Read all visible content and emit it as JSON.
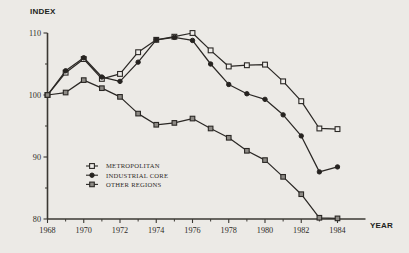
{
  "chart_data": {
    "type": "line",
    "title": "",
    "xlabel": "YEAR",
    "ylabel": "INDEX",
    "xlim": [
      1968,
      1984
    ],
    "ylim": [
      80,
      110
    ],
    "yticks": [
      80,
      90,
      100,
      110
    ],
    "ytick_labels": [
      "80",
      "90",
      "100",
      "110"
    ],
    "xticks": [
      1968,
      1969,
      1970,
      1971,
      1972,
      1973,
      1974,
      1975,
      1976,
      1977,
      1978,
      1979,
      1980,
      1981,
      1982,
      1983,
      1984
    ],
    "xtick_labels_shown": [
      "1968",
      "1970",
      "1972",
      "1974",
      "1980",
      "1982",
      "1984"
    ],
    "xtick_labels_all": [
      "1968",
      "",
      "1970",
      "",
      "1972",
      "",
      "1974",
      "",
      "1976",
      "",
      "1978",
      "",
      "1980",
      "",
      "1982",
      "",
      "1984"
    ],
    "grid": false,
    "legend_position": "lower-left-inside",
    "x": [
      1968,
      1969,
      1970,
      1971,
      1972,
      1973,
      1974,
      1975,
      1976,
      1977,
      1978,
      1979,
      1980,
      1981,
      1982,
      1983,
      1984
    ],
    "series": [
      {
        "name": "METROPOLITAN",
        "marker": "open-square",
        "values": [
          100.0,
          103.6,
          105.8,
          102.6,
          103.4,
          106.9,
          108.9,
          109.4,
          110.0,
          107.2,
          104.6,
          104.8,
          104.9,
          102.2,
          99.0,
          94.6,
          94.5
        ]
      },
      {
        "name": "INDUSTRIAL CORE",
        "marker": "filled-circle",
        "values": [
          100.0,
          103.9,
          106.0,
          102.9,
          102.2,
          105.3,
          108.9,
          109.3,
          108.8,
          105.0,
          101.7,
          100.2,
          99.3,
          96.8,
          93.4,
          87.6,
          88.4
        ]
      },
      {
        "name": "OTHER REGIONS",
        "marker": "filled-square",
        "values": [
          100.0,
          100.4,
          102.4,
          101.1,
          99.7,
          97.0,
          95.2,
          95.5,
          96.2,
          94.6,
          93.1,
          91.0,
          89.5,
          86.8,
          84.0,
          80.2,
          80.1
        ]
      }
    ]
  },
  "legend": {
    "items": [
      {
        "label": "METROPOLITAN"
      },
      {
        "label": "INDUSTRIAL CORE"
      },
      {
        "label": "OTHER REGIONS"
      }
    ]
  },
  "axes": {
    "y_title": "INDEX",
    "x_title": "YEAR"
  },
  "colors": {
    "background": "#eceae6",
    "ink": "#2b2825",
    "marker_gray": "#8d8a85"
  }
}
